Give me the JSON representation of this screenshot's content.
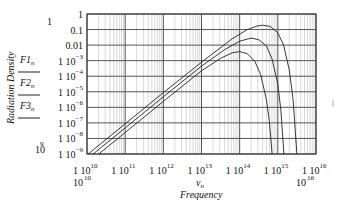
{
  "chart_data": {
    "type": "line",
    "title": "",
    "xlabel": "Frequency",
    "xvar": "ν_n",
    "ylabel": "Radiation Density",
    "xscale": "log",
    "yscale": "log",
    "xlim": [
      10000000000.0,
      1e+16
    ],
    "ylim": [
      1e-09,
      1
    ],
    "grid": true,
    "legend_position": "left",
    "x_tick_labels": [
      "1 10^10",
      "1 10^11",
      "1 10^12",
      "1 10^13",
      "1 10^14",
      "1 10^15",
      "1 10^16"
    ],
    "x_range_labels": {
      "min": "10^10",
      "max": "10^16"
    },
    "y_tick_labels": [
      "1",
      "0.1",
      "0.01",
      "1 10^-3",
      "1 10^-4",
      "1 10^-5",
      "1 10^-6",
      "1 10^-7",
      "1 10^-8",
      "1 10^-9"
    ],
    "y_range_labels": {
      "max": "1",
      "min": "10^-9"
    },
    "series": [
      {
        "name": "F1_n",
        "log_points": [
          [
            10.03,
            -9.0
          ],
          [
            11.0,
            -7.06
          ],
          [
            12.0,
            -5.06
          ],
          [
            13.0,
            -3.1
          ],
          [
            13.8,
            -1.6
          ],
          [
            14.2,
            -1.0
          ],
          [
            14.45,
            -0.78
          ],
          [
            14.6,
            -0.72
          ],
          [
            14.8,
            -0.8
          ],
          [
            15.0,
            -1.2
          ],
          [
            15.15,
            -2.0
          ],
          [
            15.3,
            -3.6
          ],
          [
            15.4,
            -5.5
          ],
          [
            15.5,
            -9.0
          ]
        ]
      },
      {
        "name": "F2_n",
        "log_points": [
          [
            10.16,
            -9.0
          ],
          [
            11.0,
            -7.32
          ],
          [
            12.0,
            -5.32
          ],
          [
            13.0,
            -3.35
          ],
          [
            13.6,
            -2.3
          ],
          [
            14.0,
            -1.75
          ],
          [
            14.3,
            -1.55
          ],
          [
            14.5,
            -1.65
          ],
          [
            14.7,
            -2.05
          ],
          [
            14.85,
            -2.9
          ],
          [
            15.0,
            -4.5
          ],
          [
            15.08,
            -6.2
          ],
          [
            15.16,
            -9.0
          ]
        ]
      },
      {
        "name": "F3_n",
        "log_points": [
          [
            10.31,
            -9.0
          ],
          [
            11.0,
            -7.62
          ],
          [
            12.0,
            -5.62
          ],
          [
            13.0,
            -3.65
          ],
          [
            13.5,
            -2.85
          ],
          [
            13.8,
            -2.5
          ],
          [
            14.0,
            -2.42
          ],
          [
            14.2,
            -2.55
          ],
          [
            14.4,
            -3.05
          ],
          [
            14.55,
            -3.9
          ],
          [
            14.7,
            -5.5
          ],
          [
            14.78,
            -6.9
          ],
          [
            14.85,
            -9.0
          ]
        ]
      }
    ]
  },
  "legend": {
    "items": [
      {
        "label": "F1",
        "sub": "n"
      },
      {
        "label": "F2",
        "sub": "n"
      },
      {
        "label": "F3",
        "sub": "n"
      }
    ]
  },
  "axes": {
    "ylabel": "Radiation Density",
    "xlabel": "Frequency",
    "xvar": "ν",
    "xvar_sub": "n",
    "y_top_label": "1",
    "y_bottom_label_base": "10",
    "y_bottom_label_exp": "9",
    "x_left_label_base": "10",
    "x_left_label_exp": "10",
    "x_right_label_base": "10",
    "x_right_label_exp": "16"
  },
  "colors": {
    "curve": "#222222",
    "major_grid": "#555555",
    "minor_grid": "#c8c8c8",
    "frame": "#333333"
  }
}
